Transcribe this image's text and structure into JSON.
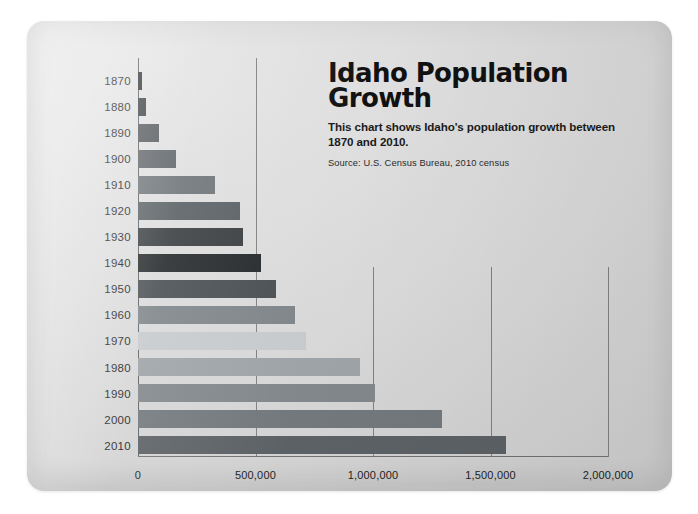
{
  "chart_data": {
    "type": "bar",
    "orientation": "horizontal",
    "title": "Idaho Population Growth",
    "subtitle": "This chart shows Idaho's population growth between 1870 and 2010.",
    "source": "Source: U.S. Census Bureau, 2010 census",
    "xlabel": "",
    "ylabel": "",
    "categories": [
      "1870",
      "1880",
      "1890",
      "1900",
      "1910",
      "1920",
      "1930",
      "1940",
      "1950",
      "1960",
      "1970",
      "1980",
      "1990",
      "2000",
      "2010"
    ],
    "values": [
      15000,
      33000,
      89000,
      162000,
      326000,
      432000,
      445000,
      525000,
      589000,
      667000,
      713000,
      944000,
      1007000,
      1294000,
      1568000
    ],
    "xlim": [
      0,
      2000000
    ],
    "xticks": [
      0,
      500000,
      1000000,
      1500000,
      2000000
    ],
    "xtick_labels": [
      "0",
      "500,000",
      "1,000,000",
      "1,500,000",
      "2,000,000"
    ],
    "grid": "vertical",
    "legend": "none",
    "bar_colors": [
      "#2f3133",
      "#3c4043",
      "#53585c",
      "#5e6367",
      "#6e7478",
      "#5a6064",
      "#3a3e41",
      "#26292b",
      "#4a4f53",
      "#7f8589",
      "#c6cacd",
      "#9ea3a7",
      "#82878b",
      "#72787c",
      "#5c6165"
    ]
  },
  "axis": {
    "tick_0": "0",
    "tick_1": "500,000",
    "tick_2": "1,000,000",
    "tick_3": "1,500,000",
    "tick_4": "2,000,000"
  },
  "colors": {
    "card_background": "#dedede",
    "gridline": "#6f7274",
    "axis": "#5d6063",
    "text": "#1c1c1c",
    "title": "#111111"
  }
}
